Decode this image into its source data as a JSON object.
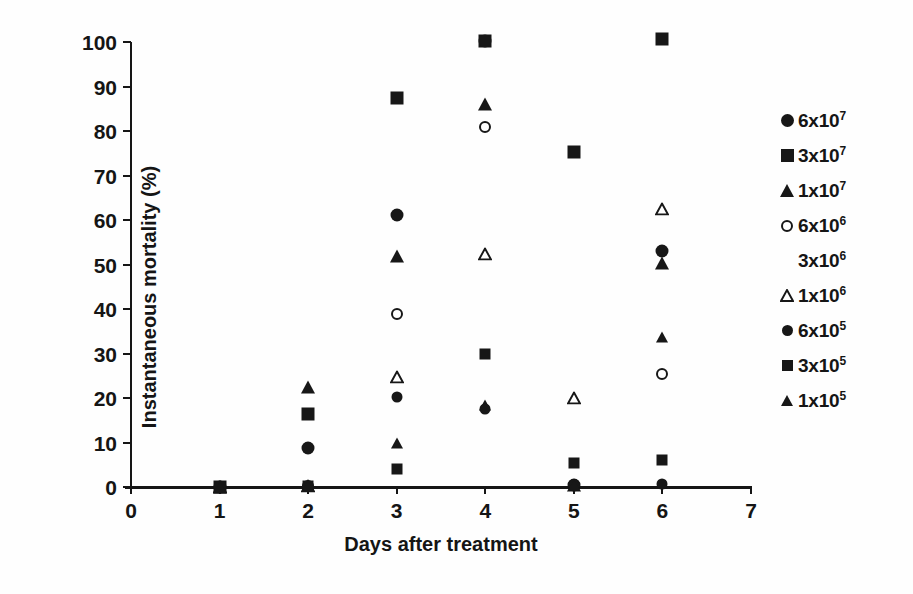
{
  "chart_data": {
    "type": "scatter",
    "title": "",
    "xlabel": "Days after treatment",
    "ylabel": "Instantaneous mortality (%)",
    "xlim": [
      0,
      7
    ],
    "ylim": [
      0,
      100
    ],
    "xticks": [
      0,
      1,
      2,
      3,
      4,
      5,
      6,
      7
    ],
    "yticks": [
      0,
      10,
      20,
      30,
      40,
      50,
      60,
      70,
      80,
      90,
      100
    ],
    "grid": false,
    "legend_position": "right",
    "x": [
      1,
      2,
      3,
      4,
      5,
      6
    ],
    "series": [
      {
        "name": "6x10^7",
        "label": "6x10",
        "exponent": "7",
        "marker": "circle-filled",
        "values": [
          0,
          8.7,
          61.2,
          100.3,
          0.5,
          53.0
        ]
      },
      {
        "name": "3x10^7",
        "label": "3x10",
        "exponent": "7",
        "marker": "square-filled",
        "values": [
          0,
          16.3,
          87.5,
          100.3,
          75.2,
          100.6
        ]
      },
      {
        "name": "1x10^7",
        "label": "1x10",
        "exponent": "7",
        "marker": "triangle-filled",
        "values": [
          0,
          22.4,
          52.0,
          86.0,
          0.4,
          50.3
        ]
      },
      {
        "name": "6x10^6",
        "label": "6x10",
        "exponent": "6",
        "marker": "circle-open",
        "values": [
          0,
          0.3,
          38.8,
          81.0,
          0.4,
          25.3
        ]
      },
      {
        "name": "3x10^6",
        "label": "3x10",
        "exponent": "6",
        "marker": "none",
        "values": [
          0,
          0.3,
          0.3,
          0.4,
          0.4,
          0.6
        ]
      },
      {
        "name": "1x10^6",
        "label": "1x10",
        "exponent": "6",
        "marker": "triangle-open",
        "values": [
          0,
          0.3,
          24.8,
          52.4,
          20.1,
          62.5
        ]
      },
      {
        "name": "6x10^5",
        "label": "6x10",
        "exponent": "5",
        "marker": "circle-filled-sm",
        "values": [
          0,
          0.3,
          20.2,
          17.6,
          0.4,
          0.7
        ]
      },
      {
        "name": "3x10^5",
        "label": "3x10",
        "exponent": "5",
        "marker": "square-filled-sm",
        "values": [
          0,
          0.3,
          4.0,
          30.0,
          5.5,
          6.0
        ]
      },
      {
        "name": "1x10^5",
        "label": "1x10",
        "exponent": "5",
        "marker": "triangle-filled-sm",
        "values": [
          0,
          0.3,
          9.8,
          18.4,
          0.4,
          33.7
        ]
      }
    ],
    "points": [
      {
        "series": "6x10^7",
        "marker": "circle-filled",
        "x": 1,
        "y": 0
      },
      {
        "series": "3x10^7",
        "marker": "square-filled",
        "x": 1,
        "y": 0
      },
      {
        "series": "1x10^7",
        "marker": "triangle-filled",
        "x": 1,
        "y": 0
      },
      {
        "series": "6x10^6",
        "marker": "circle-open",
        "x": 1,
        "y": 0
      },
      {
        "series": "1x10^6",
        "marker": "triangle-open",
        "x": 1,
        "y": 0
      },
      {
        "series": "6x10^5",
        "marker": "circle-filled-sm",
        "x": 1,
        "y": 0
      },
      {
        "series": "3x10^5",
        "marker": "square-filled-sm",
        "x": 1,
        "y": 0
      },
      {
        "series": "1x10^5",
        "marker": "triangle-filled-sm",
        "x": 1,
        "y": 0
      },
      {
        "series": "1x10^7",
        "marker": "triangle-filled",
        "x": 2,
        "y": 22.4
      },
      {
        "series": "3x10^7",
        "marker": "square-filled",
        "x": 2,
        "y": 16.3
      },
      {
        "series": "6x10^7",
        "marker": "circle-filled",
        "x": 2,
        "y": 8.7
      },
      {
        "series": "6x10^6",
        "marker": "circle-open",
        "x": 2,
        "y": 0.3
      },
      {
        "series": "1x10^6",
        "marker": "triangle-open",
        "x": 2,
        "y": 0.3
      },
      {
        "series": "6x10^5",
        "marker": "circle-filled-sm",
        "x": 2,
        "y": 0.3
      },
      {
        "series": "3x10^5",
        "marker": "square-filled-sm",
        "x": 2,
        "y": 0.3
      },
      {
        "series": "1x10^5",
        "marker": "triangle-filled-sm",
        "x": 2,
        "y": 0.3
      },
      {
        "series": "3x10^7",
        "marker": "square-filled",
        "x": 3,
        "y": 87.5
      },
      {
        "series": "6x10^7",
        "marker": "circle-filled",
        "x": 3,
        "y": 61.2
      },
      {
        "series": "1x10^7",
        "marker": "triangle-filled",
        "x": 3,
        "y": 52.0
      },
      {
        "series": "6x10^6",
        "marker": "circle-open",
        "x": 3,
        "y": 38.8
      },
      {
        "series": "1x10^6",
        "marker": "triangle-open",
        "x": 3,
        "y": 24.8
      },
      {
        "series": "6x10^5",
        "marker": "circle-filled-sm",
        "x": 3,
        "y": 20.2
      },
      {
        "series": "1x10^5",
        "marker": "triangle-filled-sm",
        "x": 3,
        "y": 9.8
      },
      {
        "series": "3x10^5",
        "marker": "square-filled-sm",
        "x": 3,
        "y": 4.0
      },
      {
        "series": "3x10^6",
        "marker": "none",
        "x": 3,
        "y": 0.3
      },
      {
        "series": "3x10^7",
        "marker": "square-filled",
        "x": 4,
        "y": 100.3
      },
      {
        "series": "6x10^7",
        "marker": "circle-filled",
        "x": 4,
        "y": 100.3
      },
      {
        "series": "1x10^7",
        "marker": "triangle-filled",
        "x": 4,
        "y": 86.0
      },
      {
        "series": "6x10^6",
        "marker": "circle-open",
        "x": 4,
        "y": 81.0
      },
      {
        "series": "1x10^6",
        "marker": "triangle-open",
        "x": 4,
        "y": 52.4
      },
      {
        "series": "3x10^5",
        "marker": "square-filled-sm",
        "x": 4,
        "y": 30.0
      },
      {
        "series": "1x10^5",
        "marker": "triangle-filled-sm",
        "x": 4,
        "y": 18.4
      },
      {
        "series": "6x10^5",
        "marker": "circle-filled-sm",
        "x": 4,
        "y": 17.6
      },
      {
        "series": "3x10^6",
        "marker": "none",
        "x": 4,
        "y": 0.4
      },
      {
        "series": "3x10^7",
        "marker": "square-filled",
        "x": 5,
        "y": 75.2
      },
      {
        "series": "1x10^6",
        "marker": "triangle-open",
        "x": 5,
        "y": 20.1
      },
      {
        "series": "3x10^5",
        "marker": "square-filled-sm",
        "x": 5,
        "y": 5.5
      },
      {
        "series": "6x10^7",
        "marker": "circle-filled",
        "x": 5,
        "y": 0.5
      },
      {
        "series": "6x10^6",
        "marker": "circle-open",
        "x": 5,
        "y": 0.4
      },
      {
        "series": "1x10^7",
        "marker": "triangle-filled",
        "x": 5,
        "y": 0.4
      },
      {
        "series": "6x10^5",
        "marker": "circle-filled-sm",
        "x": 5,
        "y": 0.4
      },
      {
        "series": "1x10^5",
        "marker": "triangle-filled-sm",
        "x": 5,
        "y": 0.4
      },
      {
        "series": "3x10^7",
        "marker": "square-filled",
        "x": 6,
        "y": 100.6
      },
      {
        "series": "1x10^6",
        "marker": "triangle-open",
        "x": 6,
        "y": 62.5
      },
      {
        "series": "6x10^7",
        "marker": "circle-filled",
        "x": 6,
        "y": 53.0
      },
      {
        "series": "1x10^7",
        "marker": "triangle-filled",
        "x": 6,
        "y": 50.3
      },
      {
        "series": "1x10^5",
        "marker": "triangle-filled-sm",
        "x": 6,
        "y": 33.7
      },
      {
        "series": "6x10^6",
        "marker": "circle-open",
        "x": 6,
        "y": 25.3
      },
      {
        "series": "3x10^5",
        "marker": "square-filled-sm",
        "x": 6,
        "y": 6.0
      },
      {
        "series": "6x10^5",
        "marker": "circle-filled-sm",
        "x": 6,
        "y": 0.7
      }
    ]
  },
  "axes": {
    "y_title": "Instantaneous mortality (%)",
    "x_title": "Days after treatment",
    "y_ticks": [
      "0",
      "10",
      "20",
      "30",
      "40",
      "50",
      "60",
      "70",
      "80",
      "90",
      "100"
    ],
    "x_ticks": [
      "0",
      "1",
      "2",
      "3",
      "4",
      "5",
      "6",
      "7"
    ]
  },
  "legend": {
    "entries": [
      {
        "label": "6x10",
        "exponent": "7",
        "marker": "circle-filled"
      },
      {
        "label": "3x10",
        "exponent": "7",
        "marker": "square-filled"
      },
      {
        "label": "1x10",
        "exponent": "7",
        "marker": "triangle-filled"
      },
      {
        "label": "6x10",
        "exponent": "6",
        "marker": "circle-open"
      },
      {
        "label": "3x10",
        "exponent": "6",
        "marker": "none"
      },
      {
        "label": "1x10",
        "exponent": "6",
        "marker": "triangle-open"
      },
      {
        "label": "6x10",
        "exponent": "5",
        "marker": "circle-filled-sm"
      },
      {
        "label": "3x10",
        "exponent": "5",
        "marker": "square-filled-sm"
      },
      {
        "label": "1x10",
        "exponent": "5",
        "marker": "triangle-filled-sm"
      }
    ]
  },
  "colors": {
    "marker": "#171717",
    "axis": "#161616",
    "background": "#ffffff"
  },
  "scan_artifacts": [
    {
      "text": "",
      "left": 40,
      "top": 478
    },
    {
      "text": "",
      "left": 560,
      "top": 478
    }
  ]
}
